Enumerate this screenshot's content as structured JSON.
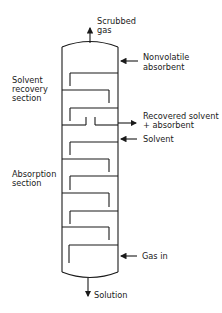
{
  "diagram": {
    "labels": {
      "top_outlet": [
        "Scrubbed",
        "gas"
      ],
      "absorbent_inlet": [
        "Nonvolatile",
        "absorbent"
      ],
      "recovery_section": [
        "Solvent",
        "recovery",
        "section"
      ],
      "recovered_outlet": [
        "Recovered solvent",
        "+ absorbent"
      ],
      "solvent_inlet": [
        "Solvent"
      ],
      "absorption_section": [
        "Absorption",
        "section"
      ],
      "gas_inlet": [
        "Gas in"
      ],
      "bottom_outlet": [
        "Solution"
      ]
    },
    "colors": {
      "line": "#1a1a1a",
      "background": "#ffffff"
    }
  }
}
